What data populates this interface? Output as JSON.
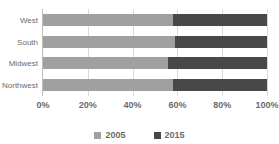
{
  "chart_data": {
    "type": "bar",
    "orientation": "horizontal",
    "stacked": true,
    "normalized": true,
    "title": "",
    "xlabel": "",
    "ylabel": "",
    "categories": [
      "West",
      "South",
      "Midwest",
      "Northwest"
    ],
    "series": [
      {
        "name": "2005",
        "color": "#a0a0a0",
        "values": [
          58,
          59,
          56,
          58
        ]
      },
      {
        "name": "2015",
        "color": "#484848",
        "values": [
          42,
          41,
          44,
          42
        ]
      }
    ],
    "xlim": [
      0,
      100
    ],
    "xticks": [
      0,
      20,
      40,
      60,
      80,
      100
    ],
    "xtick_labels": [
      "0%",
      "20%",
      "40%",
      "60%",
      "80%",
      "100%"
    ],
    "grid": true,
    "grid_axis": "x",
    "legend_position": "bottom",
    "legend_entries": [
      "2005",
      "2015"
    ]
  },
  "colors": {
    "series_2005": "#a0a0a0",
    "series_2015": "#484848",
    "gridline": "#d9d9d9",
    "axis": "#bdbdbd",
    "text": "#6b6b6b",
    "background": "#ffffff"
  }
}
